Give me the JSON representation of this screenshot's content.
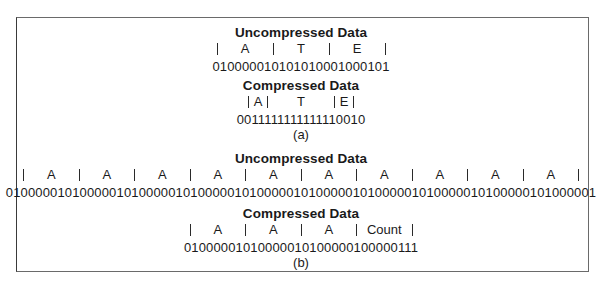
{
  "figure": {
    "part_a": {
      "uncompressed": {
        "title": "Uncompressed Data",
        "cells": [
          "A",
          "T",
          "E"
        ],
        "bits": "010000010101010001000101"
      },
      "compressed": {
        "title": "Compressed Data",
        "cells": [
          "A",
          "T",
          "E"
        ],
        "bits": "0011111111111110010"
      },
      "caption": "(a)"
    },
    "part_b": {
      "uncompressed": {
        "title": "Uncompressed Data",
        "cells": [
          "A",
          "A",
          "A",
          "A",
          "A",
          "A",
          "A",
          "A",
          "A",
          "A"
        ],
        "bits": "01000001010000010100000101000001010000010100000101000001010000010100000101000001"
      },
      "compressed": {
        "title": "Compressed Data",
        "cells": [
          "A",
          "A",
          "A",
          "Count"
        ],
        "bits": "01000001010000010100000100000111"
      },
      "caption": "(b)"
    }
  }
}
